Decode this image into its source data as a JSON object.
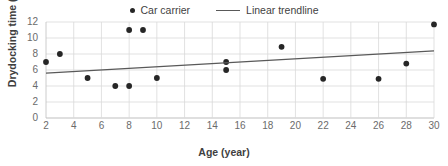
{
  "chart_data": {
    "type": "scatter",
    "title": "",
    "xlabel": "Age (year)",
    "ylabel": "Drydocking time (day)",
    "xlim": [
      2,
      30
    ],
    "ylim": [
      0,
      12
    ],
    "xticks": [
      2,
      4,
      6,
      8,
      10,
      12,
      14,
      16,
      18,
      20,
      22,
      24,
      26,
      28,
      30
    ],
    "yticks": [
      0,
      2,
      4,
      6,
      8,
      10,
      12
    ],
    "grid": true,
    "legend_position": "top-center",
    "series": [
      {
        "name": "Car carrier",
        "type": "scatter",
        "marker": "circle",
        "color": "#262626",
        "points": [
          {
            "x": 2,
            "y": 7.0
          },
          {
            "x": 3,
            "y": 8.0
          },
          {
            "x": 5,
            "y": 5.0
          },
          {
            "x": 7,
            "y": 4.0
          },
          {
            "x": 8,
            "y": 4.0
          },
          {
            "x": 8,
            "y": 11.0
          },
          {
            "x": 9,
            "y": 11.0
          },
          {
            "x": 10,
            "y": 5.0
          },
          {
            "x": 15,
            "y": 7.0
          },
          {
            "x": 15,
            "y": 6.0
          },
          {
            "x": 19,
            "y": 8.9
          },
          {
            "x": 22,
            "y": 4.9
          },
          {
            "x": 26,
            "y": 4.9
          },
          {
            "x": 28,
            "y": 6.8
          },
          {
            "x": 30,
            "y": 11.7
          }
        ]
      },
      {
        "name": "Linear trendline",
        "type": "line",
        "color": "#595959",
        "endpoints": [
          {
            "x": 2,
            "y": 5.6
          },
          {
            "x": 30,
            "y": 8.4
          }
        ]
      }
    ]
  },
  "legend": {
    "entries": [
      {
        "label": "Car carrier",
        "marker": "dot"
      },
      {
        "label": "Linear trendline",
        "marker": "line"
      }
    ]
  },
  "colors": {
    "marker": "#262626",
    "trendline": "#595959",
    "grid": "#d9d9d9",
    "axis": "#bfbfbf",
    "tick_text": "#6b6b6b",
    "title_text": "#3f3f3f"
  }
}
